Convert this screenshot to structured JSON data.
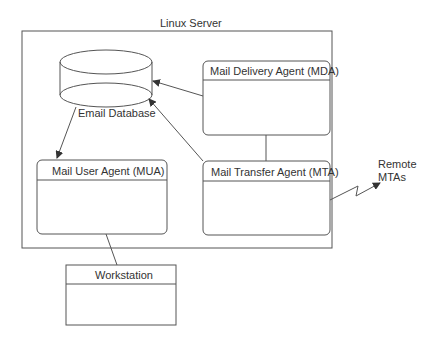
{
  "diagram": {
    "container": {
      "label": "Linux Server"
    },
    "database": {
      "label": "Email Database"
    },
    "nodes": {
      "mda": {
        "label": "Mail Delivery Agent (MDA)"
      },
      "mta": {
        "label": "Mail Transfer Agent (MTA)"
      },
      "mua": {
        "label": "Mail User Agent (MUA)"
      },
      "workstation": {
        "label": "Workstation"
      }
    },
    "external": {
      "label_line1": "Remote",
      "label_line2": "MTAs"
    },
    "colors": {
      "stroke": "#555555",
      "text": "#333333",
      "background": "#ffffff"
    }
  }
}
